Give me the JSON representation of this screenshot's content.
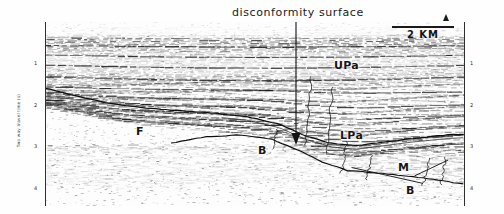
{
  "figure": {
    "type": "seismic-reflection-profile",
    "caption": "disconformity surface"
  },
  "scale_bar": {
    "label": "2 KM",
    "length_km": 2
  },
  "y_axis": {
    "title": "Two way travel time (s)",
    "ticks": [
      "1",
      "2",
      "3",
      "4"
    ],
    "unit": "s",
    "min": 0,
    "max": 4.4
  },
  "annotations": {
    "unit_upper_pannonian": "UPa",
    "unit_lower_pannonian": "LPa",
    "unit_miocene": "M",
    "basement_right": "B",
    "basement_center": "B",
    "fault": "F"
  },
  "chart_data": {
    "type": "line",
    "title": "disconformity surface",
    "xlabel": "",
    "ylabel": "Two way travel time (s)",
    "ylim": [
      0,
      4.4
    ],
    "xlim": [
      0,
      100
    ],
    "grid": false,
    "legend": "none",
    "annotations": [
      {
        "text": "disconformity surface",
        "x": 50,
        "y": 0.0
      },
      {
        "text": "UPa",
        "x": 69,
        "y": 1.15
      },
      {
        "text": "LPa",
        "x": 71,
        "y": 2.72
      },
      {
        "text": "M",
        "x": 85,
        "y": 3.45
      },
      {
        "text": "B",
        "x": 87,
        "y": 3.95
      },
      {
        "text": "B",
        "x": 51,
        "y": 2.95
      },
      {
        "text": "F",
        "x": 22,
        "y": 2.55
      }
    ],
    "series": [
      {
        "name": "disconformity surface horizon",
        "x": [
          0,
          8,
          16,
          24,
          32,
          40,
          48,
          56,
          62,
          68,
          74,
          80,
          88,
          96,
          100
        ],
        "values": [
          1.58,
          1.78,
          1.96,
          2.06,
          2.12,
          2.18,
          2.26,
          2.45,
          2.72,
          2.9,
          2.96,
          2.88,
          2.78,
          2.7,
          2.68
        ]
      },
      {
        "name": "basement top",
        "x": [
          30,
          38,
          46,
          54,
          60,
          66,
          72,
          80,
          88,
          96,
          100
        ],
        "values": [
          2.9,
          2.75,
          2.7,
          2.8,
          3.05,
          3.35,
          3.55,
          3.62,
          3.7,
          3.82,
          3.88
        ]
      },
      {
        "name": "arrow pointer",
        "x": [
          50,
          50
        ],
        "values": [
          0.1,
          2.78
        ]
      }
    ]
  }
}
